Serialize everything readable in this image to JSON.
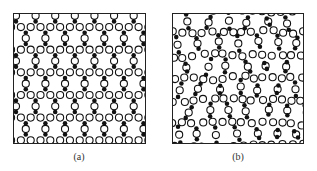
{
  "figure": {
    "panels": [
      {
        "id": "a",
        "label": "(a)",
        "structure": "crystalline",
        "description": "ordered honeycomb silica network (hexagonal rings)",
        "lattice_bond_px": 11.5,
        "offset_x": 2,
        "offset_y": -3,
        "disorder": 0
      },
      {
        "id": "b",
        "label": "(b)",
        "structure": "amorphous",
        "description": "disordered silica network (irregular rings)",
        "lattice_bond_px": 11.5,
        "offset_x": -4,
        "offset_y": 1,
        "disorder": 3.2,
        "seed": 7
      }
    ],
    "atoms": {
      "network_former": {
        "color": "#111111",
        "radius": 2.3
      },
      "bridge": {
        "fill": "#ffffff",
        "stroke": "#111111",
        "radius": 3.6,
        "stroke_width": 1.1
      }
    },
    "frame_color": "#222222"
  }
}
